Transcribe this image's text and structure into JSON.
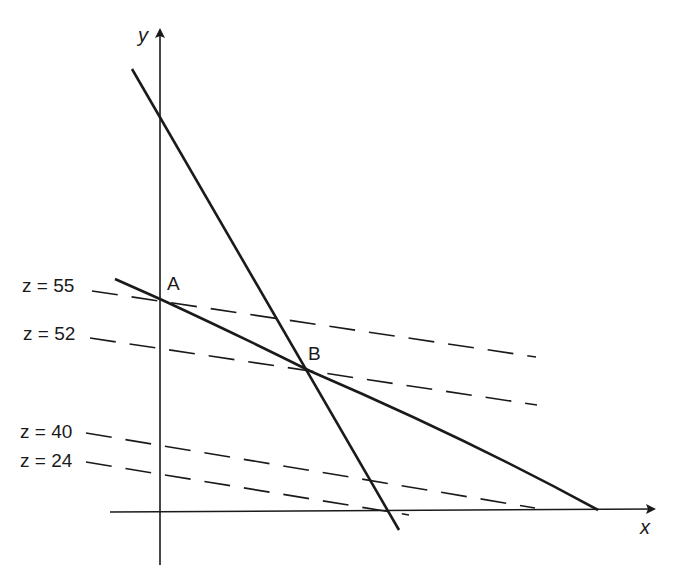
{
  "diagram": {
    "type": "linear-programming-graphical-solution",
    "axes": {
      "x_label": "x",
      "y_label": "y"
    },
    "points": [
      {
        "id": "A",
        "label": "A"
      },
      {
        "id": "B",
        "label": "B"
      }
    ],
    "constraint_lines": [
      {
        "id": "steep-constraint",
        "style": "solid"
      },
      {
        "id": "shallow-constraint",
        "style": "solid"
      }
    ],
    "objective_lines": [
      {
        "id": "z55",
        "label": "z = 55",
        "z": 55,
        "style": "dashed"
      },
      {
        "id": "z52",
        "label": "z = 52",
        "z": 52,
        "style": "dashed"
      },
      {
        "id": "z40",
        "label": "z = 40",
        "z": 40,
        "style": "dashed"
      },
      {
        "id": "z24",
        "label": "z = 24",
        "z": 24,
        "style": "dashed"
      }
    ],
    "colors": {
      "ink": "#1a1a1a",
      "background": "#ffffff"
    }
  }
}
